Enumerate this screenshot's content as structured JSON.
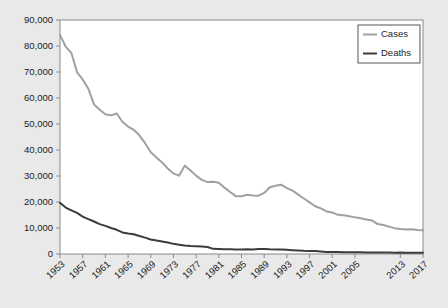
{
  "chart_data": {
    "type": "line",
    "title": "",
    "subtitle": "",
    "xlabel": "",
    "ylabel": "",
    "xlim": [
      1953,
      2017
    ],
    "ylim": [
      0,
      90000
    ],
    "grid": false,
    "legend_position": "top-right",
    "y_ticks": [
      0,
      10000,
      20000,
      30000,
      40000,
      50000,
      60000,
      70000,
      80000,
      90000
    ],
    "y_tick_labels": [
      "0",
      "10,000",
      "20,000",
      "30,000",
      "40,000",
      "50,000",
      "60,000",
      "70,000",
      "80,000",
      "90,000"
    ],
    "x_ticks": [
      1953,
      1957,
      1961,
      1965,
      1969,
      1973,
      1977,
      1981,
      1985,
      1989,
      1993,
      1997,
      2001,
      2005,
      2013,
      2017
    ],
    "x_tick_labels": [
      "1953",
      "1957",
      "1961",
      "1965",
      "1969",
      "1973",
      "1977",
      "1981",
      "1985",
      "1989",
      "1993",
      "1997",
      "2001",
      "2005",
      "2013",
      "2017"
    ],
    "x": [
      1953,
      1954,
      1955,
      1956,
      1957,
      1958,
      1959,
      1960,
      1961,
      1962,
      1963,
      1964,
      1965,
      1966,
      1967,
      1968,
      1969,
      1970,
      1971,
      1972,
      1973,
      1974,
      1975,
      1976,
      1977,
      1978,
      1979,
      1980,
      1981,
      1982,
      1983,
      1984,
      1985,
      1986,
      1987,
      1988,
      1989,
      1990,
      1991,
      1992,
      1993,
      1994,
      1995,
      1996,
      1997,
      1998,
      1999,
      2000,
      2001,
      2002,
      2003,
      2004,
      2005,
      2006,
      2007,
      2008,
      2009,
      2010,
      2011,
      2012,
      2013,
      2014,
      2015,
      2016,
      2017
    ],
    "series": [
      {
        "name": "Cases",
        "color": "#a0a0a0",
        "width": 2.0,
        "values": [
          84304,
          79775,
          77368,
          69895,
          67149,
          63534,
          57535,
          55494,
          53726,
          53315,
          54042,
          50874,
          49016,
          47767,
          45647,
          42623,
          39120,
          37137,
          35217,
          32882,
          30998,
          30122,
          33989,
          32105,
          30145,
          28521,
          27669,
          27749,
          27373,
          25520,
          23846,
          22255,
          22201,
          22768,
          22517,
          22436,
          23495,
          25701,
          26283,
          26673,
          25313,
          24361,
          22860,
          21337,
          19855,
          18361,
          17531,
          16377,
          15989,
          15075,
          14874,
          14517,
          14093,
          13779,
          13299,
          12906,
          11520,
          11163,
          10521,
          9945,
          9582,
          9412,
          9557,
          9272,
          9105
        ]
      },
      {
        "name": "Deaths",
        "color": "#3c3c3c",
        "width": 2.0,
        "values": [
          19707,
          17845,
          16800,
          15800,
          14400,
          13400,
          12500,
          11500,
          10800,
          10000,
          9300,
          8300,
          7900,
          7600,
          6900,
          6300,
          5600,
          5200,
          4800,
          4400,
          3900,
          3600,
          3300,
          3100,
          3000,
          2900,
          2700,
          1978,
          1937,
          1807,
          1779,
          1752,
          1752,
          1782,
          1755,
          1921,
          1970,
          1810,
          1713,
          1705,
          1631,
          1478,
          1336,
          1202,
          1166,
          1112,
          930,
          776,
          764,
          784,
          711,
          662,
          648,
          644,
          554,
          590,
          529,
          569,
          539,
          510,
          555,
          493,
          470,
          528,
          515
        ]
      }
    ]
  },
  "legend": {
    "items": [
      {
        "label": "Cases",
        "color": "#a0a0a0"
      },
      {
        "label": "Deaths",
        "color": "#3c3c3c"
      }
    ]
  },
  "axes": {
    "frame_color": "#8a8a8a",
    "tick_color": "#8a8a8a",
    "plot_background": "#ffffff",
    "page_background": "#e9e9e9",
    "text_color": "#1c1c1c"
  }
}
